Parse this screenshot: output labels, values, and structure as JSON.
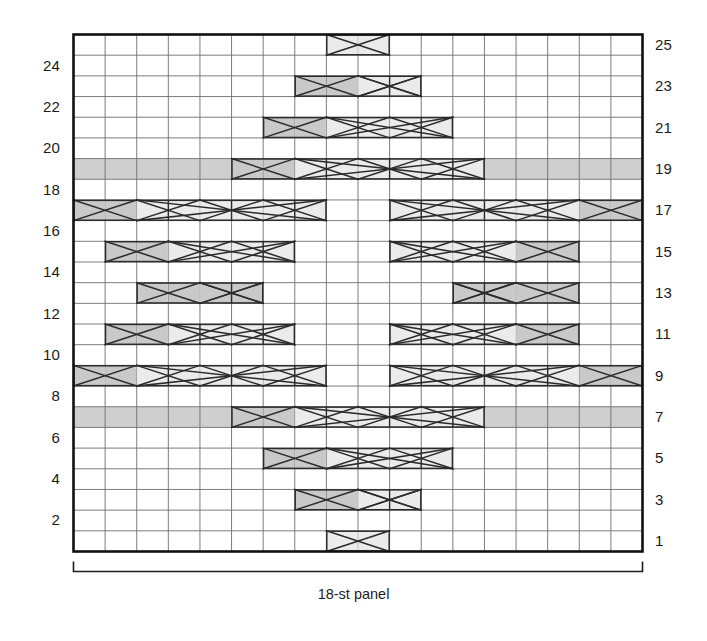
{
  "chart_title": "",
  "caption": "18-st panel",
  "chart_data": {
    "type": "table",
    "chart_kind": "knitting-cable-chart",
    "stitch_columns": 18,
    "rows_total": 25,
    "row_numbering": {
      "left_side_rows": [
        2,
        4,
        6,
        8,
        10,
        12,
        14,
        16,
        18,
        20,
        22,
        24
      ],
      "right_side_rows": [
        1,
        3,
        5,
        7,
        9,
        11,
        13,
        15,
        17,
        19,
        21,
        23,
        25
      ],
      "left_label_note": "even rows numbered on left",
      "right_label_note": "odd rows numbered on right"
    },
    "axis_ranges": {
      "x": [
        1,
        18
      ],
      "y": [
        1,
        25
      ]
    },
    "grid": true,
    "legend_position": "none",
    "colors": {
      "background": "#ffffff",
      "grid_line": "#6e6e6e",
      "border": "#111111",
      "cable_light_fill": "#ebebeb",
      "cable_dark_fill": "#c9c9c9",
      "band_fill": "#cfcfcf",
      "symbol_stroke": "#2b2b2b",
      "text": "#1b1b1b"
    },
    "cell_types": {
      "empty": "knit / plain stitch (blank cell)",
      "band": "shaded background band (purl / reverse stocking ground)",
      "cable_light": "light-shaded cable travel cell",
      "cable_dark": "dark-shaded cable travel cell"
    },
    "rows": [
      {
        "row": 25,
        "shaded_band": false,
        "cable_spans": [
          {
            "start": 9,
            "width": 2,
            "tone": "light",
            "symbol": "cross-x"
          }
        ]
      },
      {
        "row": 24,
        "shaded_band": false,
        "cable_spans": []
      },
      {
        "row": 23,
        "shaded_band": false,
        "cable_spans": [
          {
            "start": 8,
            "width": 4,
            "tone": "mixed",
            "symbol": "cable-run"
          }
        ]
      },
      {
        "row": 22,
        "shaded_band": false,
        "cable_spans": []
      },
      {
        "row": 21,
        "shaded_band": false,
        "cable_spans": [
          {
            "start": 7,
            "width": 6,
            "tone": "mixed",
            "symbol": "cable-run"
          }
        ]
      },
      {
        "row": 20,
        "shaded_band": false,
        "cable_spans": []
      },
      {
        "row": 19,
        "shaded_band": true,
        "cable_spans": [
          {
            "start": 6,
            "width": 8,
            "tone": "mixed",
            "symbol": "cable-run"
          }
        ]
      },
      {
        "row": 18,
        "shaded_band": false,
        "cable_spans": []
      },
      {
        "row": 17,
        "shaded_band": false,
        "cable_spans": [
          {
            "start": 1,
            "width": 8,
            "tone": "mixed",
            "symbol": "cable-run"
          },
          {
            "start": 11,
            "width": 8,
            "tone": "mixed",
            "symbol": "cable-run"
          }
        ]
      },
      {
        "row": 16,
        "shaded_band": false,
        "cable_spans": []
      },
      {
        "row": 15,
        "shaded_band": false,
        "cable_spans": [
          {
            "start": 2,
            "width": 6,
            "tone": "mixed",
            "symbol": "cable-run"
          },
          {
            "start": 11,
            "width": 6,
            "tone": "mixed",
            "symbol": "cable-run"
          }
        ]
      },
      {
        "row": 14,
        "shaded_band": false,
        "cable_spans": []
      },
      {
        "row": 13,
        "shaded_band": false,
        "cable_spans": [
          {
            "start": 3,
            "width": 4,
            "tone": "dark",
            "symbol": "cable-run"
          },
          {
            "start": 13,
            "width": 4,
            "tone": "dark",
            "symbol": "cable-run"
          }
        ]
      },
      {
        "row": 12,
        "shaded_band": false,
        "cable_spans": []
      },
      {
        "row": 11,
        "shaded_band": false,
        "cable_spans": [
          {
            "start": 2,
            "width": 6,
            "tone": "mixed",
            "symbol": "cable-run"
          },
          {
            "start": 11,
            "width": 6,
            "tone": "mixed",
            "symbol": "cable-run"
          }
        ]
      },
      {
        "row": 10,
        "shaded_band": false,
        "cable_spans": []
      },
      {
        "row": 9,
        "shaded_band": false,
        "cable_spans": [
          {
            "start": 1,
            "width": 8,
            "tone": "mixed",
            "symbol": "cable-run"
          },
          {
            "start": 11,
            "width": 8,
            "tone": "mixed",
            "symbol": "cable-run"
          }
        ]
      },
      {
        "row": 8,
        "shaded_band": false,
        "cable_spans": []
      },
      {
        "row": 7,
        "shaded_band": true,
        "cable_spans": [
          {
            "start": 6,
            "width": 8,
            "tone": "mixed",
            "symbol": "cable-run"
          }
        ]
      },
      {
        "row": 6,
        "shaded_band": false,
        "cable_spans": []
      },
      {
        "row": 5,
        "shaded_band": false,
        "cable_spans": [
          {
            "start": 7,
            "width": 6,
            "tone": "mixed",
            "symbol": "cable-run"
          }
        ]
      },
      {
        "row": 4,
        "shaded_band": false,
        "cable_spans": []
      },
      {
        "row": 3,
        "shaded_band": false,
        "cable_spans": [
          {
            "start": 8,
            "width": 4,
            "tone": "mixed",
            "symbol": "cable-run"
          }
        ]
      },
      {
        "row": 2,
        "shaded_band": false,
        "cable_spans": []
      },
      {
        "row": 1,
        "shaded_band": false,
        "cable_spans": [
          {
            "start": 9,
            "width": 2,
            "tone": "light",
            "symbol": "cross-x"
          }
        ]
      }
    ]
  }
}
